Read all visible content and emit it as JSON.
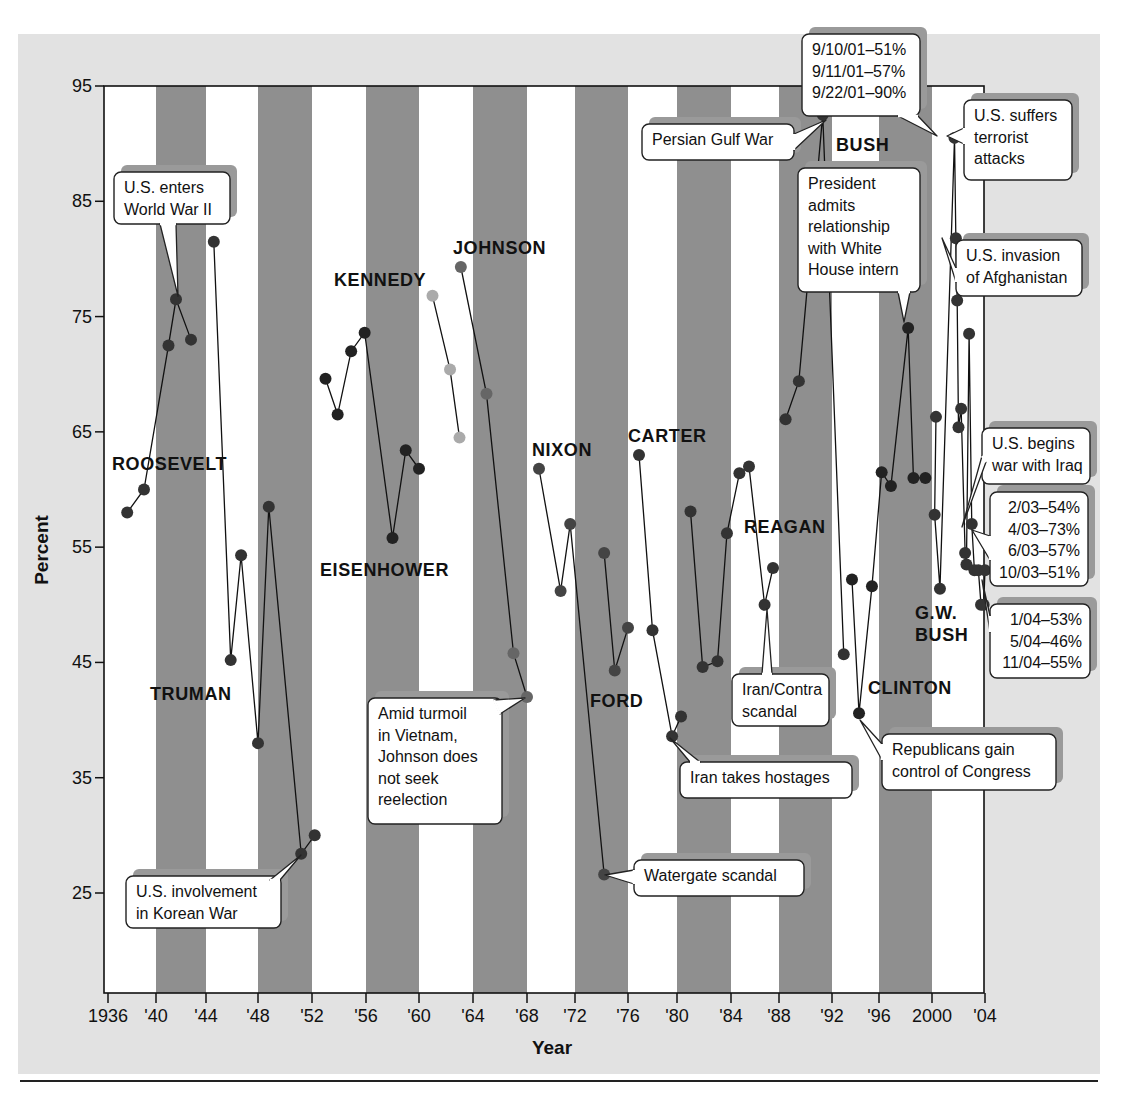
{
  "chart_data": {
    "type": "line",
    "title": "",
    "xlabel": "Year",
    "ylabel": "Percent",
    "ylim": [
      16.4,
      95
    ],
    "xlim": [
      1936,
      2004
    ],
    "y_ticks": [
      95,
      85,
      75,
      65,
      55,
      45,
      35,
      25
    ],
    "x_ticks": [
      {
        "year": 1936,
        "label": "1936"
      },
      {
        "year": 1940,
        "label": "'40"
      },
      {
        "year": 1944,
        "label": "'44"
      },
      {
        "year": 1948,
        "label": "'48"
      },
      {
        "year": 1952,
        "label": "'52"
      },
      {
        "year": 1956,
        "label": "'56"
      },
      {
        "year": 1960,
        "label": "'60"
      },
      {
        "year": 1964,
        "label": "'64"
      },
      {
        "year": 1968,
        "label": "'68"
      },
      {
        "year": 1972,
        "label": "'72"
      },
      {
        "year": 1976,
        "label": "'76"
      },
      {
        "year": 1980,
        "label": "'80"
      },
      {
        "year": 1984,
        "label": "'84"
      },
      {
        "year": 1988,
        "label": "'88"
      },
      {
        "year": 1992,
        "label": "'92"
      },
      {
        "year": 1996,
        "label": "'96"
      },
      {
        "year": 2000,
        "label": "2000"
      },
      {
        "year": 2004,
        "label": "'04"
      }
    ],
    "shaded_bands": [
      [
        1940,
        1944
      ],
      [
        1948,
        1952
      ],
      [
        1956,
        1960
      ],
      [
        1964,
        1968
      ],
      [
        1972,
        1976
      ],
      [
        1980,
        1984
      ],
      [
        1988,
        1992
      ],
      [
        1996,
        2000
      ]
    ],
    "grid": false,
    "legend": "none",
    "series": [
      {
        "name": "Roosevelt",
        "color": "#333333",
        "label": {
          "text": "ROOSEVELT",
          "x": 112,
          "y": 470
        },
        "points": [
          [
            1937.6,
            58
          ],
          [
            1939,
            60
          ],
          [
            1941,
            72.5
          ],
          [
            1941.6,
            76.5
          ],
          [
            1942.8,
            73
          ]
        ]
      },
      {
        "name": "Truman",
        "color": "#333333",
        "label": {
          "text": "TRUMAN",
          "x": 150,
          "y": 700
        },
        "points": [
          [
            1944.6,
            81.5
          ],
          [
            1945.9,
            45.2
          ],
          [
            1946.7,
            54.3
          ],
          [
            1948,
            38
          ],
          [
            1948.8,
            58.5
          ],
          [
            1951.2,
            28.4
          ],
          [
            1952.2,
            30
          ]
        ]
      },
      {
        "name": "Eisenhower",
        "color": "#222222",
        "label": {
          "text": "EISENHOWER",
          "x": 320,
          "y": 576
        },
        "points": [
          [
            1953,
            69.6
          ],
          [
            1953.9,
            66.5
          ],
          [
            1954.9,
            72
          ],
          [
            1955.9,
            73.6
          ],
          [
            1958,
            55.8
          ],
          [
            1959,
            63.4
          ],
          [
            1960,
            61.8
          ]
        ]
      },
      {
        "name": "Kennedy",
        "color": "#aaaaaa",
        "label": {
          "text": "KENNEDY",
          "x": 334,
          "y": 286
        },
        "points": [
          [
            1961,
            76.8
          ],
          [
            1962.3,
            70.4
          ],
          [
            1963,
            64.5
          ]
        ]
      },
      {
        "name": "Johnson",
        "color": "#666666",
        "label": {
          "text": "JOHNSON",
          "x": 453,
          "y": 254
        },
        "points": [
          [
            1963.1,
            79.3
          ],
          [
            1965,
            68.3
          ],
          [
            1967,
            45.8
          ],
          [
            1968,
            42
          ]
        ]
      },
      {
        "name": "Nixon",
        "color": "#444444",
        "label": {
          "text": "NIXON",
          "x": 532,
          "y": 456
        },
        "points": [
          [
            1969,
            61.8
          ],
          [
            1970.8,
            51.2
          ],
          [
            1971.6,
            57
          ],
          [
            1974.2,
            26.6
          ]
        ]
      },
      {
        "name": "Ford",
        "color": "#444444",
        "label": {
          "text": "FORD",
          "x": 590,
          "y": 707
        },
        "points": [
          [
            1974.2,
            54.5
          ],
          [
            1975,
            44.3
          ],
          [
            1976,
            48
          ]
        ]
      },
      {
        "name": "Carter",
        "color": "#333333",
        "label": {
          "text": "CARTER",
          "x": 628,
          "y": 442
        },
        "points": [
          [
            1976.9,
            63
          ],
          [
            1978,
            47.8
          ],
          [
            1979.6,
            38.6
          ],
          [
            1980.3,
            40.3
          ]
        ]
      },
      {
        "name": "Reagan",
        "color": "#333333",
        "label": {
          "text": "REAGAN",
          "x": 744,
          "y": 533
        },
        "points": [
          [
            1981,
            58.1
          ],
          [
            1981.9,
            44.6
          ],
          [
            1983,
            45.1
          ],
          [
            1983.7,
            56.2
          ],
          [
            1984.7,
            61.4
          ],
          [
            1985.5,
            62
          ],
          [
            1986.8,
            50
          ],
          [
            1987.5,
            53.2
          ]
        ]
      },
      {
        "name": "Bush",
        "color": "#333333",
        "label": {
          "text": "BUSH",
          "x": 836,
          "y": 151
        },
        "points": [
          [
            1988.5,
            66.1
          ],
          [
            1989.5,
            69.4
          ],
          [
            1991.3,
            92.5
          ],
          [
            1993,
            45.7
          ]
        ]
      },
      {
        "name": "Clinton",
        "color": "#222222",
        "label": {
          "text": "CLINTON",
          "x": 868,
          "y": 694
        },
        "points": [
          [
            1993.7,
            52.2
          ],
          [
            1994.3,
            40.6
          ],
          [
            1995.4,
            51.6
          ],
          [
            1996.2,
            61.5
          ],
          [
            1996.9,
            60.3
          ],
          [
            1998.2,
            74
          ],
          [
            1998.6,
            61
          ],
          [
            1999.5,
            61
          ]
        ]
      },
      {
        "name": "G.W. Bush",
        "color": "#333333",
        "label": {
          "text": "G.W.|BUSH",
          "x": 915,
          "y": 619
        },
        "points": [
          [
            2000.3,
            66.3
          ],
          [
            2000.2,
            57.8
          ],
          [
            2000.6,
            51.4
          ],
          [
            2001.7,
            90.5
          ],
          [
            2001.8,
            81.8
          ],
          [
            2001.9,
            76.4
          ],
          [
            2002,
            65.4
          ],
          [
            2002.2,
            67
          ],
          [
            2002.5,
            54.5
          ],
          [
            2002.6,
            53.5
          ],
          [
            2002.8,
            73.5
          ],
          [
            2003,
            57
          ],
          [
            2003.2,
            53
          ],
          [
            2003.5,
            53
          ],
          [
            2003.7,
            50
          ],
          [
            2003.9,
            50
          ],
          [
            2004,
            53
          ]
        ]
      }
    ],
    "annotations": [
      {
        "id": "ww2",
        "lines": [
          "U.S. enters",
          "World War II"
        ],
        "box": [
          114,
          172,
          116,
          52
        ],
        "pointer": [
          [
            160,
            224
          ],
          [
            178,
            296
          ],
          [
            176,
            224
          ]
        ]
      },
      {
        "id": "korea",
        "lines": [
          "U.S. involvement",
          "in Korean War"
        ],
        "box": [
          126,
          876,
          155,
          52
        ],
        "pointer": [
          [
            270,
            880
          ],
          [
            301,
            855
          ],
          [
            280,
            880
          ]
        ]
      },
      {
        "id": "vietnam",
        "lines": [
          "Amid turmoil",
          "in Vietnam,",
          "Johnson does",
          "not seek",
          "reelection"
        ],
        "box": [
          368,
          698,
          134,
          126
        ],
        "pointer": [
          [
            494,
            700
          ],
          [
            525,
            698
          ],
          [
            500,
            714
          ]
        ]
      },
      {
        "id": "watergate",
        "lines": [
          "Watergate scandal"
        ],
        "box": [
          634,
          860,
          170,
          36
        ],
        "pointer": [
          [
            634,
            870
          ],
          [
            605,
            875
          ],
          [
            634,
            884
          ]
        ]
      },
      {
        "id": "hostages",
        "lines": [
          "Iran takes hostages"
        ],
        "box": [
          680,
          762,
          172,
          36
        ],
        "pointer": [
          [
            690,
            762
          ],
          [
            670,
            738
          ],
          [
            700,
            762
          ]
        ]
      },
      {
        "id": "irancontra",
        "lines": [
          "Iran/Contra",
          "scandal"
        ],
        "box": [
          732,
          674,
          97,
          52
        ],
        "pointer": [
          [
            762,
            674
          ],
          [
            767,
            609
          ],
          [
            772,
            674
          ]
        ]
      },
      {
        "id": "gulfwar",
        "lines": [
          "Persian Gulf War"
        ],
        "box": [
          642,
          124,
          152,
          36
        ],
        "pointer": [
          [
            794,
            134
          ],
          [
            826,
            120
          ],
          [
            794,
            150
          ]
        ]
      },
      {
        "id": "sept11box",
        "lines": [
          "9/10/01–51%",
          "9/11/01–57%",
          "9/22/01–90%"
        ],
        "box": [
          802,
          34,
          118,
          82
        ],
        "pointer": [
          [
            898,
            116
          ],
          [
            937,
            136
          ],
          [
            918,
            116
          ]
        ]
      },
      {
        "id": "terror",
        "lines": [
          "U.S. suffers",
          "terrorist",
          "attacks"
        ],
        "box": [
          964,
          100,
          108,
          80
        ],
        "pointer": [
          [
            964,
            128
          ],
          [
            947,
            136
          ],
          [
            964,
            144
          ]
        ]
      },
      {
        "id": "intern",
        "lines": [
          "President",
          "admits",
          "relationship",
          "with White",
          "House intern"
        ],
        "box": [
          798,
          168,
          122,
          124
        ],
        "pointer": [
          [
            898,
            292
          ],
          [
            904,
            322
          ],
          [
            910,
            292
          ]
        ]
      },
      {
        "id": "afghanistan",
        "lines": [
          "U.S. invasion",
          "of Afghanistan"
        ],
        "box": [
          956,
          240,
          126,
          56
        ],
        "pointer": [
          [
            956,
            268
          ],
          [
            942,
            238
          ],
          [
            956,
            282
          ]
        ]
      },
      {
        "id": "iraq",
        "lines": [
          "U.S. begins",
          "war with Iraq"
        ],
        "box": [
          982,
          428,
          108,
          56
        ],
        "pointer": [
          [
            982,
            456
          ],
          [
            962,
            527
          ],
          [
            986,
            462
          ]
        ]
      },
      {
        "id": "iraqpct",
        "lines": [
          "2/03–54%",
          "4/03–73%",
          "6/03–57%",
          "10/03–51%"
        ],
        "box": [
          990,
          492,
          98,
          94
        ],
        "pointer": [
          [
            990,
            536
          ],
          [
            972,
            530
          ],
          [
            990,
            560
          ]
        ]
      },
      {
        "id": "pct2004",
        "lines": [
          "1/04–53%",
          "5/04–46%",
          "11/04–55%"
        ],
        "box": [
          990,
          604,
          100,
          74
        ],
        "pointer": [
          [
            990,
            616
          ],
          [
            982,
            580
          ],
          [
            990,
            632
          ]
        ]
      },
      {
        "id": "congress",
        "lines": [
          "Republicans gain",
          "control of Congress"
        ],
        "box": [
          882,
          734,
          174,
          56
        ],
        "pointer": [
          [
            882,
            744
          ],
          [
            860,
            720
          ],
          [
            882,
            760
          ]
        ]
      }
    ]
  },
  "layout": {
    "plot_left": 104,
    "plot_right": 984,
    "plot_top": 86,
    "plot_bottom": 993,
    "tick_pixels": {
      "1936": 108,
      "1940": 156,
      "1944": 206,
      "1948": 258,
      "1952": 312,
      "1956": 366,
      "1960": 419,
      "1964": 473,
      "1968": 527,
      "1972": 575,
      "1976": 628,
      "1980": 677,
      "1984": 731,
      "1988": 779,
      "1992": 832,
      "1996": 879,
      "2000": 932,
      "2004": 985
    },
    "colors": {
      "band": "#8f8f8f",
      "panel": "#e2e2e2",
      "line": "#111111"
    }
  }
}
